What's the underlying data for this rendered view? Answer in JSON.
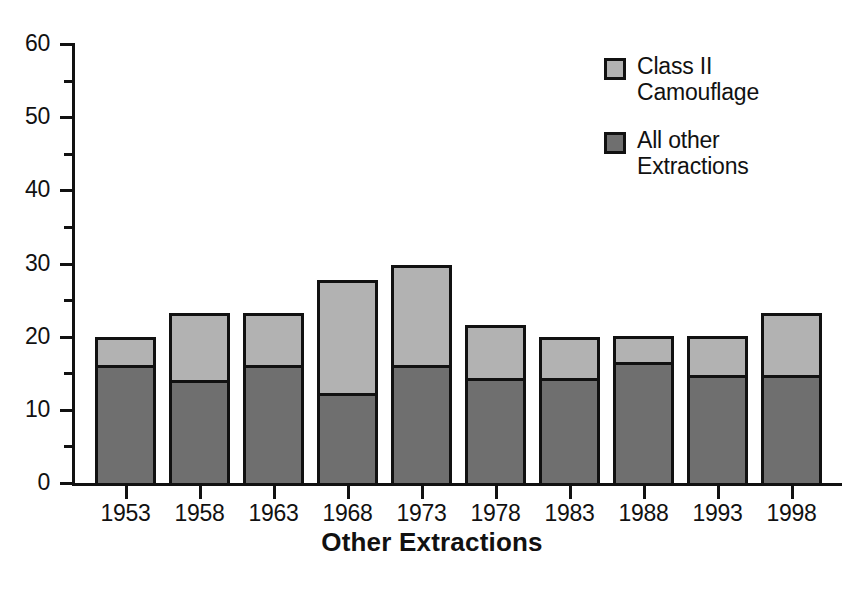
{
  "chart_data": {
    "type": "bar",
    "subtype": "stacked-vertical",
    "title": "",
    "xlabel": "Other Extractions",
    "ylabel": "",
    "categories": [
      "1953",
      "1958",
      "1963",
      "1968",
      "1973",
      "1978",
      "1983",
      "1988",
      "1993",
      "1998"
    ],
    "series": [
      {
        "name": "All other Extractions",
        "color": "#6f6f6f",
        "values": [
          16.1,
          14.1,
          16.1,
          12.3,
          16.1,
          14.4,
          14.4,
          16.5,
          14.7,
          14.7
        ]
      },
      {
        "name": "Class II Camouflage",
        "color": "#b2b2b2",
        "values": [
          3.9,
          9.1,
          7.1,
          15.4,
          13.7,
          7.2,
          5.6,
          3.6,
          5.4,
          8.6
        ]
      }
    ],
    "totals": [
      20.0,
      23.2,
      23.2,
      27.7,
      29.8,
      21.6,
      20.0,
      20.1,
      20.1,
      23.3
    ],
    "ylim": [
      0,
      60
    ],
    "ytick_major": [
      0,
      10,
      20,
      30,
      40,
      50,
      60
    ],
    "ytick_minor": [
      5,
      15,
      25,
      35,
      45,
      55
    ],
    "ytick_labels": [
      "0",
      "10",
      "20",
      "30",
      "40",
      "50",
      "60"
    ],
    "grid": false,
    "legend_position": "top-right",
    "legend": [
      {
        "label": "Class II\nCamouflage",
        "color": "#b2b2b2"
      },
      {
        "label": "All other\nExtractions",
        "color": "#6f6f6f"
      }
    ]
  },
  "axis": {
    "x_title": "Other Extractions",
    "y_labels": [
      "60",
      "50",
      "40",
      "30",
      "20",
      "10",
      "0"
    ],
    "x_labels": [
      "1953",
      "1958",
      "1963",
      "1968",
      "1973",
      "1978",
      "1983",
      "1988",
      "1993",
      "1998"
    ]
  },
  "legend": {
    "entries": [
      {
        "label": "Class II\nCamouflage"
      },
      {
        "label": "All other\nExtractions"
      }
    ]
  },
  "caption": {
    "text": ""
  },
  "colors": {
    "class_ii_camouflage": "#b2b2b2",
    "all_other_extractions": "#6f6f6f",
    "ink": "#111111",
    "background": "#ffffff"
  }
}
